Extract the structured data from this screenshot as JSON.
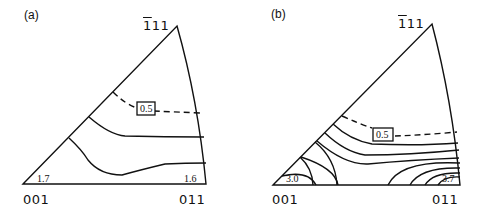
{
  "panels": [
    {
      "label": "(a)",
      "corners": {
        "origin": "001",
        "right": "011",
        "apex_bar": "1",
        "apex_rest": "11"
      },
      "values": {
        "left": "1.7",
        "right": "1.6",
        "contour_label": "0.5"
      }
    },
    {
      "label": "(b)",
      "corners": {
        "origin": "001",
        "right": "011",
        "apex_bar": "1",
        "apex_rest": "11"
      },
      "values": {
        "left": "3.0",
        "right": "3.7",
        "contour_label": "0.5"
      }
    }
  ]
}
